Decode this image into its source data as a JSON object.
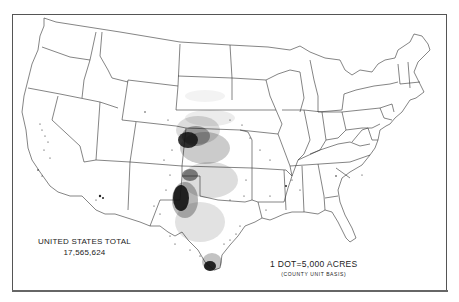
{
  "map": {
    "subject": "Dot-density map of the United States",
    "legend": {
      "dot_value": "1 DOT=5,000 ACRES",
      "basis": "(COUNTY UNIT BASIS)"
    },
    "total": {
      "label": "UNITED STATES TOTAL",
      "value": "17,565,624"
    },
    "colors": {
      "background": "#ffffff",
      "lines": "#333333",
      "dots": "#111111"
    },
    "density_hotspots": [
      {
        "region": "Western Kansas / Eastern Colorado",
        "intensity": "very high"
      },
      {
        "region": "Texas Panhandle / Oklahoma Panhandle",
        "intensity": "very high"
      },
      {
        "region": "South Texas (Coastal Bend)",
        "intensity": "high"
      },
      {
        "region": "Central Kansas / Nebraska",
        "intensity": "medium"
      },
      {
        "region": "Central / North Texas",
        "intensity": "medium"
      },
      {
        "region": "California Central Valley",
        "intensity": "low"
      },
      {
        "region": "Arizona (Salt River)",
        "intensity": "low"
      }
    ]
  }
}
